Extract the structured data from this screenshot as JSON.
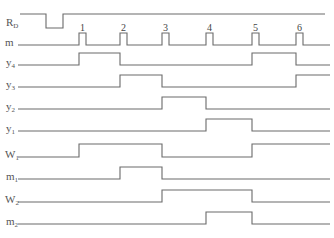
{
  "diagram": {
    "type": "timing-diagram",
    "pulse_labels": [
      "1",
      "2",
      "3",
      "4",
      "5",
      "6"
    ],
    "signals": [
      {
        "name": "R",
        "sub": "D",
        "kind": "reset",
        "segments": "high, low briefly before clock 1, then high"
      },
      {
        "name": "m",
        "sub": "",
        "kind": "clock",
        "pulses": [
          1,
          2,
          3,
          4,
          5,
          6
        ]
      },
      {
        "name": "y",
        "sub": "4",
        "high_intervals": [
          [
            1,
            2
          ],
          [
            5,
            6
          ]
        ]
      },
      {
        "name": "y",
        "sub": "3",
        "high_intervals": [
          [
            2,
            3
          ],
          [
            6,
            7
          ]
        ]
      },
      {
        "name": "y",
        "sub": "2",
        "high_intervals": [
          [
            3,
            4
          ]
        ]
      },
      {
        "name": "y",
        "sub": "1",
        "high_intervals": [
          [
            4,
            5
          ]
        ]
      },
      {
        "name": "W",
        "sub": "1",
        "high_intervals": [
          [
            1,
            3
          ],
          [
            5,
            7
          ]
        ]
      },
      {
        "name": "m",
        "sub": "1",
        "high_intervals": [
          [
            2,
            3
          ]
        ]
      },
      {
        "name": "W",
        "sub": "2",
        "high_intervals": [
          [
            3,
            5
          ]
        ]
      },
      {
        "name": "m",
        "sub": "2",
        "high_intervals": [
          [
            4,
            5
          ]
        ]
      }
    ]
  }
}
